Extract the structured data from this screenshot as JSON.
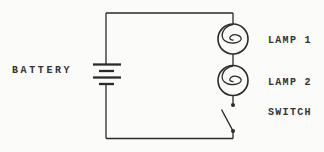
{
  "diagram": {
    "kind": "circuit-schematic",
    "connection": "series loop: battery -> lamp1 -> lamp2 -> open switch -> battery",
    "components": [
      {
        "id": "battery",
        "label": "BATTERY",
        "symbol": "battery-icon"
      },
      {
        "id": "lamp1",
        "label": "LAMP 1",
        "symbol": "lamp-icon"
      },
      {
        "id": "lamp2",
        "label": "LAMP 2",
        "symbol": "lamp-icon"
      },
      {
        "id": "switch",
        "label": "SWITCH",
        "symbol": "switch-open-icon",
        "state": "open"
      }
    ],
    "colors": {
      "line": "#2a2a2a",
      "text": "#333333",
      "background": "#fbfbf9"
    }
  }
}
